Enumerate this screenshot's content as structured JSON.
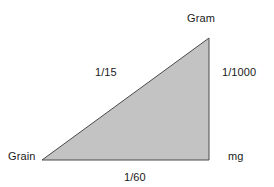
{
  "figure": {
    "type": "conversion-triangle-diagram",
    "background_color": "#ffffff",
    "triangle": {
      "fill_color": "#c3c3c3",
      "stroke_color": "#4a4a4a",
      "stroke_width": 1,
      "shape": "right-triangle",
      "right_angle_at": "bottom-right",
      "vertices": {
        "bottom_left": {
          "x": 42,
          "y": 160
        },
        "bottom_right": {
          "x": 209,
          "y": 160
        },
        "top_right": {
          "x": 209,
          "y": 38
        }
      }
    },
    "vertex_labels": {
      "top_right": "Gram",
      "bottom_right": "mg",
      "bottom_left": "Grain"
    },
    "edge_labels": {
      "hypotenuse": "1/15",
      "vertical": "1/1000",
      "base": "1/60"
    }
  }
}
